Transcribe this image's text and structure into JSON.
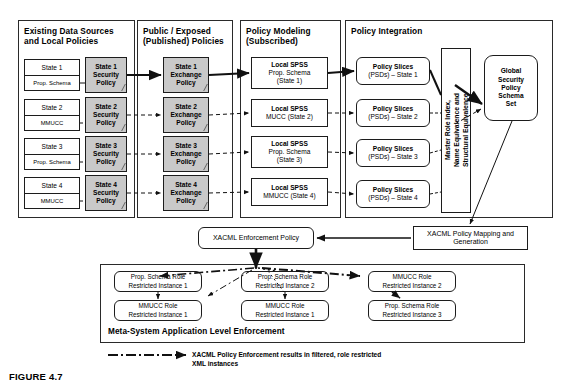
{
  "figure": {
    "caption": "FIGURE 4.7"
  },
  "panels": [
    {
      "id": "existing",
      "title": "Existing Data Sources\nand Local Policies"
    },
    {
      "id": "public",
      "title": "Public / Exposed\n(Published) Policies"
    },
    {
      "id": "modeling",
      "title": "Policy Modeling\n(Subscribed)"
    },
    {
      "id": "integration",
      "title": "Policy Integration"
    }
  ],
  "data_sources": [
    {
      "state": "State 1",
      "schema": "Prop. Schema"
    },
    {
      "state": "State 2",
      "schema": "MMUCC"
    },
    {
      "state": "State 3",
      "schema": "Prop. Schema"
    },
    {
      "state": "State 4",
      "schema": "MMUCC"
    }
  ],
  "security_policies": [
    {
      "label": "State 1\nSecurity\nPolicy"
    },
    {
      "label": "State 2\nSecurity\nPolicy"
    },
    {
      "label": "State 3\nSecurity\nPolicy"
    },
    {
      "label": "State 4\nSecurity\nPolicy"
    }
  ],
  "exchange_policies": [
    {
      "label": "State 1\nExchange\nPolicy"
    },
    {
      "label": "State 2\nExchange\nPolicy"
    },
    {
      "label": "State 3\nExchange\nPolicy"
    },
    {
      "label": "State 4\nExchange\nPolicy"
    }
  ],
  "local_spss": [
    {
      "title": "Local SPSS",
      "detail": "Prop. Schema\n(State 1)"
    },
    {
      "title": "Local SPSS",
      "detail": "MUCC (State 2)"
    },
    {
      "title": "Local SPSS",
      "detail": "Prop. Schema\n(State 3)"
    },
    {
      "title": "Local SPSS",
      "detail": "MMUCC (State 4)"
    }
  ],
  "policy_slices": [
    {
      "title": "Policy Slices",
      "detail": "(PSDs) – State 1"
    },
    {
      "title": "Policy Slices",
      "detail": "(PSDs) – State 2"
    },
    {
      "title": "Policy Slices",
      "detail": "(PSDs) – State 3"
    },
    {
      "title": "Policy Slices",
      "detail": "(PSDs) – State 4"
    }
  ],
  "master_index": {
    "label": "Master Role Index,\nName Equivalence and\nStructural Equivalence"
  },
  "global_schema": {
    "label": "Global\nSecurity\nPolicy\nSchema\nSet"
  },
  "xacml_enforcement": {
    "label": "XACML Enforcement Policy"
  },
  "xacml_mapping": {
    "label": "XACML Policy Mapping and\nGeneration"
  },
  "enforcement_panel": {
    "title": "Meta-System Application Level Enforcement",
    "instances": [
      {
        "label": "Prop. Schema Role\nRestricted Instance 1"
      },
      {
        "label": "Prop. Schema Role\nRestricted Instance 2"
      },
      {
        "label": "MMUCC Role\nRestricted Instance 2"
      },
      {
        "label": "MMUCC Role\nRestricted Instance 1"
      },
      {
        "label": "MMUCC Role\nRestricted Instance 1"
      },
      {
        "label": "Prop. Schema Role\nRestricted Instance 3"
      }
    ]
  },
  "legend": {
    "text": "XACML Policy Enforcement results in filtered, role restricted\nXML instances"
  },
  "colors": {
    "shade": "#c9c9c9",
    "line": "#1c1c1c",
    "background": "#ffffff"
  }
}
